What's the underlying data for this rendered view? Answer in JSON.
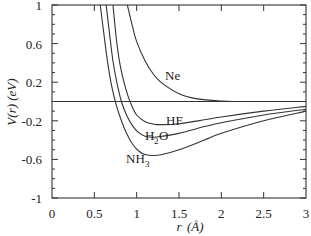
{
  "chart_data": {
    "type": "line",
    "title": "",
    "xlabel": "r(Å)",
    "ylabel": "V(r) (eV)",
    "xlim": [
      0,
      3
    ],
    "ylim": [
      -1,
      1
    ],
    "x_ticks": [
      "0",
      "0.5",
      "1",
      "1.5",
      "2",
      "2.5",
      "3"
    ],
    "y_ticks": [
      "1",
      "0.6",
      "0.2",
      "-0.2",
      "-0.6",
      "-1"
    ],
    "grid": false,
    "legend": "inline curve labels",
    "zero_line": true,
    "series": [
      {
        "name": "Ne",
        "x": [
          0.89,
          0.95,
          1.0,
          1.1,
          1.2,
          1.3,
          1.5,
          1.7,
          2.0,
          2.2,
          2.5,
          3.0
        ],
        "y": [
          1.0,
          0.78,
          0.62,
          0.42,
          0.28,
          0.19,
          0.08,
          0.03,
          0.005,
          0.0,
          0.0,
          0.0
        ]
      },
      {
        "name": "HF",
        "x": [
          0.72,
          0.76,
          0.8,
          0.85,
          0.9,
          0.95,
          1.0,
          1.1,
          1.2,
          1.3,
          1.5,
          1.8,
          2.0,
          2.5,
          3.0
        ],
        "y": [
          1.0,
          0.65,
          0.4,
          0.2,
          0.05,
          -0.06,
          -0.14,
          -0.21,
          -0.235,
          -0.24,
          -0.23,
          -0.19,
          -0.16,
          -0.1,
          -0.05
        ]
      },
      {
        "name": "H2O",
        "x": [
          0.64,
          0.68,
          0.72,
          0.77,
          0.82,
          0.88,
          0.95,
          1.02,
          1.1,
          1.2,
          1.3,
          1.5,
          1.8,
          2.0,
          2.5,
          3.0
        ],
        "y": [
          1.0,
          0.7,
          0.42,
          0.18,
          0.0,
          -0.14,
          -0.25,
          -0.32,
          -0.36,
          -0.37,
          -0.36,
          -0.33,
          -0.26,
          -0.22,
          -0.14,
          -0.08
        ]
      },
      {
        "name": "NH3",
        "x": [
          0.57,
          0.61,
          0.65,
          0.7,
          0.76,
          0.82,
          0.88,
          0.95,
          1.02,
          1.1,
          1.2,
          1.3,
          1.5,
          1.8,
          2.0,
          2.5,
          3.0
        ],
        "y": [
          1.0,
          0.72,
          0.45,
          0.18,
          -0.04,
          -0.2,
          -0.33,
          -0.44,
          -0.51,
          -0.55,
          -0.56,
          -0.55,
          -0.5,
          -0.4,
          -0.33,
          -0.2,
          -0.1
        ]
      }
    ],
    "annotations": [
      {
        "text": "Ne",
        "x": 1.48,
        "y": 0.28
      },
      {
        "text": "HF",
        "x": 1.48,
        "y": -0.2
      },
      {
        "text": "H2O",
        "x": 1.25,
        "y": -0.36
      },
      {
        "text": "NH3",
        "x": 1.03,
        "y": -0.62
      }
    ]
  },
  "labels": {
    "xlabel_r": "r",
    "xlabel_unit": "(Å)",
    "ylabel": "V(r) (eV)",
    "ne": "Ne",
    "hf": "HF",
    "h2o_h": "H",
    "h2o_sub": "2",
    "h2o_o": "O",
    "nh3_nh": "NH",
    "nh3_sub": "3"
  }
}
